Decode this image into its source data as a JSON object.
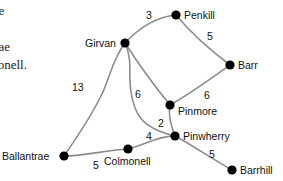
{
  "prose": {
    "lines": [
      "The",
      "es.",
      "ntrae",
      "lmonell."
    ],
    "tail": "ng"
  },
  "graph": {
    "node_color": "#000000",
    "edge_color": "#8c8c8c",
    "label_color": "#111111",
    "nodes": [
      {
        "id": "penkill",
        "label": "Penkill",
        "x": 176,
        "y": 15,
        "lx": 184,
        "ly": 9,
        "anchor": "left"
      },
      {
        "id": "girvan",
        "label": "Girvan",
        "x": 125,
        "y": 43,
        "lx": 85,
        "ly": 37,
        "anchor": "left"
      },
      {
        "id": "barr",
        "label": "Barr",
        "x": 230,
        "y": 65,
        "lx": 238,
        "ly": 59,
        "anchor": "left"
      },
      {
        "id": "pinmore",
        "label": "Pinmore",
        "x": 170,
        "y": 105,
        "lx": 178,
        "ly": 105,
        "anchor": "left"
      },
      {
        "id": "pinwherry",
        "label": "Pinwherry",
        "x": 175,
        "y": 136,
        "lx": 183,
        "ly": 130,
        "anchor": "left"
      },
      {
        "id": "colmonell",
        "label": "Colmonell",
        "x": 128,
        "y": 149,
        "lx": 104,
        "ly": 155,
        "anchor": "left"
      },
      {
        "id": "ballantrae",
        "label": "Ballantrae",
        "x": 64,
        "y": 156,
        "lx": 2,
        "ly": 150,
        "anchor": "left"
      },
      {
        "id": "barrhill",
        "label": "Barrhill",
        "x": 232,
        "y": 170,
        "lx": 240,
        "ly": 164,
        "anchor": "left"
      }
    ],
    "edges": [
      {
        "from": "girvan",
        "to": "penkill",
        "weight": "3",
        "lx": 146,
        "ly": 9,
        "path": "M125,43 C138,29 156,17 176,15"
      },
      {
        "from": "penkill",
        "to": "barr",
        "weight": "5",
        "lx": 207,
        "ly": 30,
        "path": "M176,15 C186,27 206,47 230,65"
      },
      {
        "from": "girvan",
        "to": "pinmore",
        "weight": "6",
        "lx": 135,
        "ly": 88,
        "path": "M125,43 C136,60 152,83 170,105"
      },
      {
        "from": "barr",
        "to": "pinmore",
        "weight": "6",
        "lx": 204,
        "ly": 89,
        "path": "M230,65 C212,78 190,94 170,105"
      },
      {
        "from": "pinmore",
        "to": "pinwherry",
        "weight": "2",
        "lx": 158,
        "ly": 117,
        "path": "M170,105 C168,114 171,126 175,136"
      },
      {
        "from": "pinwherry",
        "to": "colmonell",
        "weight": "4",
        "lx": 146,
        "ly": 130,
        "path": "M175,136 C162,135 146,144 128,149"
      },
      {
        "from": "pinwherry",
        "to": "barrhill",
        "weight": "5",
        "lx": 209,
        "ly": 148,
        "path": "M175,136 C192,145 214,160 232,170"
      },
      {
        "from": "colmonell",
        "to": "ballantrae",
        "weight": "5",
        "lx": 93,
        "ly": 159,
        "path": "M128,149 C108,150 84,156 64,156"
      },
      {
        "from": "ballantrae",
        "to": "girvan",
        "weight": "13",
        "lx": 72,
        "ly": 81,
        "path": "M64,156 C80,133 92,114 101,96 C110,78 112,60 125,43"
      },
      {
        "from": "girvan",
        "to": "pinwherry",
        "weight": "",
        "lx": 0,
        "ly": 0,
        "path": "M125,43 C133,60 128,75 131,92 C134,112 140,128 175,136"
      }
    ]
  }
}
